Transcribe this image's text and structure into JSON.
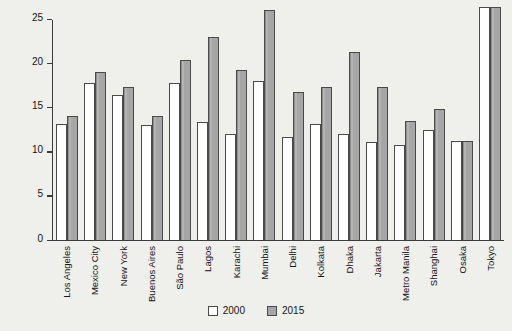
{
  "chart_data": {
    "type": "bar",
    "title": "",
    "xlabel": "",
    "ylabel": "Population in millions",
    "ylim": [
      0,
      25
    ],
    "yticks": [
      0,
      5,
      10,
      15,
      20,
      25
    ],
    "grid": false,
    "legend_position": "bottom-center",
    "categories": [
      "Los Angeles",
      "Mexico City",
      "New York",
      "Buenos Aires",
      "São Paulo",
      "Lagos",
      "Karachi",
      "Mumbai",
      "Delhi",
      "Kolkata",
      "Dhaka",
      "Jakarta",
      "Metro Manila",
      "Shanghai",
      "Osaka",
      "Tokyo"
    ],
    "series": [
      {
        "name": "2000",
        "color": "#ffffff",
        "values": [
          13.1,
          17.8,
          16.4,
          13.0,
          17.8,
          13.3,
          12.0,
          18.0,
          11.7,
          13.1,
          12.0,
          11.1,
          10.8,
          12.4,
          11.2,
          26.4
        ]
      },
      {
        "name": "2015",
        "color": "#a6a6a6",
        "values": [
          14.0,
          19.0,
          17.3,
          14.0,
          20.4,
          23.0,
          19.2,
          26.0,
          16.8,
          17.3,
          21.3,
          17.3,
          13.5,
          14.8,
          11.2,
          26.4
        ]
      }
    ]
  }
}
